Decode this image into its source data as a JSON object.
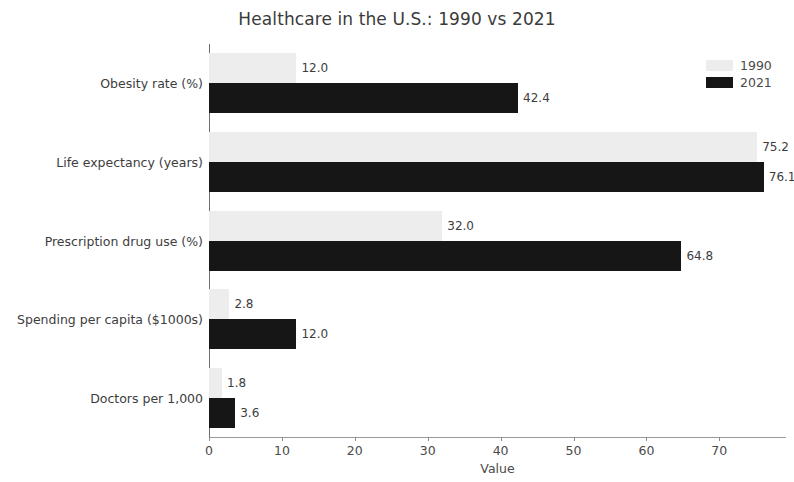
{
  "chart_data": {
    "type": "bar",
    "orientation": "horizontal",
    "title": "Healthcare in the U.S.: 1990 vs 2021",
    "xlabel": "Value",
    "ylabel": "",
    "categories": [
      "Obesity rate (%)",
      "Life expectancy (years)",
      "Prescription drug use (%)",
      "Spending per capita ($1000s)",
      "Doctors per 1,000"
    ],
    "series": [
      {
        "name": "1990",
        "color": "#ededed",
        "values": [
          12.0,
          75.2,
          32.0,
          2.8,
          1.8
        ],
        "labels": [
          "12.0",
          "75.2",
          "32.0",
          "2.8",
          "1.8"
        ]
      },
      {
        "name": "2021",
        "color": "#161616",
        "values": [
          42.4,
          76.1,
          64.8,
          12.0,
          3.6
        ],
        "labels": [
          "42.4",
          "76.1",
          "64.8",
          "12.0",
          "3.6"
        ]
      }
    ],
    "xlim": [
      0,
      79
    ],
    "xticks": [
      0,
      10,
      20,
      30,
      40,
      50,
      60,
      70
    ],
    "xtick_labels": [
      "0",
      "10",
      "20",
      "30",
      "40",
      "50",
      "60",
      "70"
    ],
    "grid": false,
    "legend_position": "upper right",
    "legend_entries": [
      "1990",
      "2021"
    ]
  }
}
